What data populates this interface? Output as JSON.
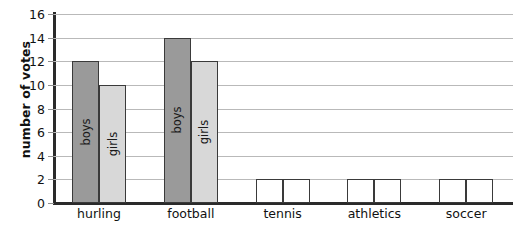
{
  "chart_data": {
    "type": "bar",
    "title": "",
    "xlabel": "",
    "ylabel": "number of votes",
    "categories": [
      "hurling",
      "football",
      "tennis",
      "athletics",
      "soccer"
    ],
    "series": [
      {
        "name": "boys",
        "values": [
          12,
          14,
          2,
          2,
          2
        ],
        "color": "#9a9a9a"
      },
      {
        "name": "girls",
        "values": [
          10,
          12,
          2,
          2,
          2
        ],
        "color": "#d8d8d8"
      }
    ],
    "ylim": [
      0,
      16
    ],
    "ytick_step": 2,
    "ytick_labels": [
      "0",
      "2",
      "4",
      "6",
      "8",
      "10",
      "12",
      "14",
      "16"
    ],
    "grid": true,
    "legend": "none",
    "bar_value_labels_shown_for": [
      "hurling",
      "football"
    ],
    "note": "tennis, athletics and soccer bars are drawn as empty outlines at height 2"
  },
  "axis": {
    "y_title": "number of votes",
    "line_color": "#2a2a2a",
    "grid_color": "#b9b9b9"
  }
}
